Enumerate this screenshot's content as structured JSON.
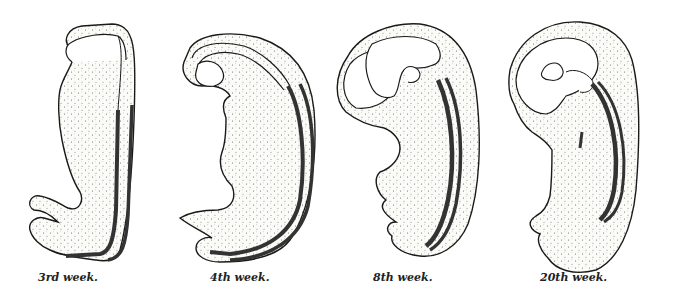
{
  "figure": {
    "panels": [
      {
        "id": "stage-3rd-week",
        "label": "3rd week."
      },
      {
        "id": "stage-4th-week",
        "label": "4th week."
      },
      {
        "id": "stage-8th-week",
        "label": "8th week."
      },
      {
        "id": "stage-20th-week",
        "label": "20th week."
      }
    ]
  },
  "colors": {
    "outline": "#1a1a1a",
    "fill": "#f6f6f2",
    "stipple": "#555555",
    "neural_tube": "#333333",
    "background": "#ffffff"
  }
}
